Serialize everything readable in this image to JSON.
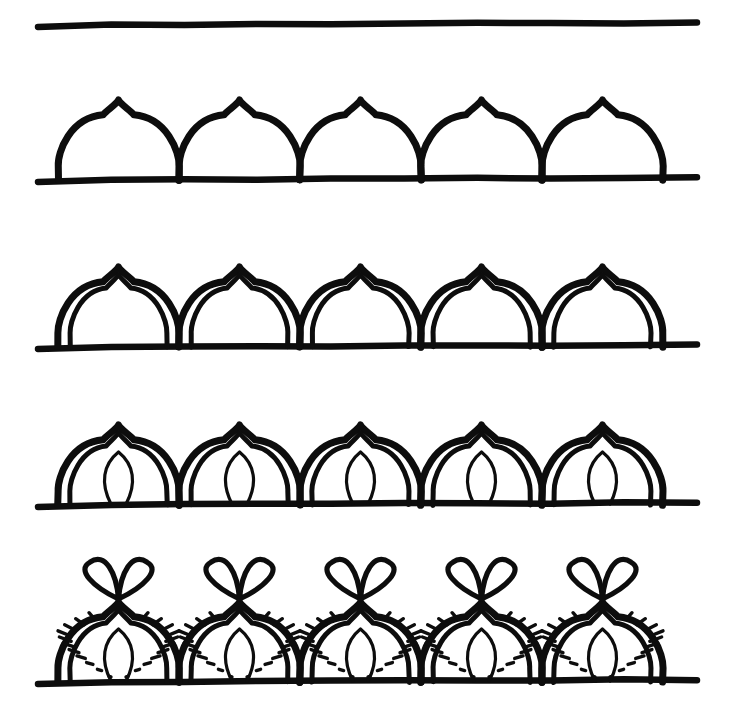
{
  "page": {
    "width": 730,
    "height": 728,
    "background_color": "#ffffff",
    "ink_color": "#0d0d0d",
    "medium": "hand-drawn black marker line art",
    "step_count": 5
  },
  "pattern": {
    "motif_name": "ogee onion dome arch",
    "repeat_count": 5,
    "dome_left_x": 58,
    "dome_spacing": 121,
    "dome_width": 121
  },
  "steps": [
    {
      "index": 0,
      "name": "guideline",
      "label": "Step 1 - draw a horizontal guide line",
      "baseline_y": 25,
      "baseline_x1": 38,
      "baseline_x2": 697,
      "has_domes": false,
      "has_inner_arch": false,
      "has_petal": false,
      "has_hatching": false,
      "has_top_loops": false
    },
    {
      "index": 1,
      "name": "outer-domes",
      "label": "Step 2 - add the row of pointed onion domes",
      "baseline_y": 180,
      "baseline_x1": 38,
      "baseline_x2": 697,
      "dome_height": 80,
      "has_domes": true,
      "has_inner_arch": false,
      "has_petal": false,
      "has_hatching": false,
      "has_top_loops": false
    },
    {
      "index": 2,
      "name": "inner-outline",
      "label": "Step 3 - echo each dome with an inner outline",
      "baseline_y": 347,
      "baseline_x1": 38,
      "baseline_x2": 697,
      "dome_height": 80,
      "has_domes": true,
      "has_inner_arch": true,
      "has_petal": false,
      "has_hatching": false,
      "has_top_loops": false
    },
    {
      "index": 3,
      "name": "center-petal",
      "label": "Step 4 - draw a teardrop petal inside each dome",
      "baseline_y": 505,
      "baseline_x1": 38,
      "baseline_x2": 697,
      "dome_height": 80,
      "has_domes": true,
      "has_inner_arch": true,
      "has_petal": true,
      "has_hatching": false,
      "has_top_loops": false
    },
    {
      "index": 4,
      "name": "hatching-and-loops",
      "label": "Step 5 - fill the band with ladder hatching and top each peak with a double loop",
      "baseline_y": 682,
      "baseline_x1": 38,
      "baseline_x2": 697,
      "dome_height": 80,
      "rung_count": 11,
      "has_domes": true,
      "has_inner_arch": true,
      "has_petal": true,
      "has_hatching": true,
      "has_top_loops": true
    }
  ]
}
